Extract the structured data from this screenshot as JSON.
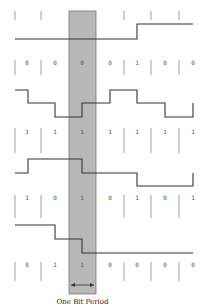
{
  "diagram": {
    "caption": "One Bit Period",
    "band": {
      "x": 69,
      "y": 11,
      "width": 27,
      "height": 283,
      "fill": "#b8b8b8",
      "stroke": "#777777"
    },
    "line_color": "#333333",
    "tick_color": "#888888",
    "digit_x": [
      27,
      55,
      82,
      110,
      137,
      165,
      193
    ],
    "tick_x": [
      15,
      41,
      124,
      151,
      179
    ],
    "rows": [
      {
        "id": "row-1",
        "ticks_top": 11,
        "ticks_bottom": 20,
        "digits": [],
        "digit_y": 0
      },
      {
        "id": "row-2",
        "ticks_top": 60,
        "ticks_bottom": 75,
        "digits": [
          "0",
          "0",
          "0",
          "0",
          "1",
          "0",
          "0"
        ],
        "digit_y": 65
      },
      {
        "id": "row-3",
        "ticks_top": 128,
        "ticks_bottom": 153,
        "digits": [
          "1",
          "1",
          "1",
          "1",
          "1",
          "1",
          "1"
        ],
        "digit_y": 134
      },
      {
        "id": "row-4",
        "ticks_top": 195,
        "ticks_bottom": 218,
        "digits": [
          "1",
          "0",
          "1",
          "0",
          "1",
          "0",
          "1"
        ],
        "digit_y": 200
      },
      {
        "id": "row-5",
        "ticks_top": 262,
        "ticks_bottom": 281,
        "digits": [
          "0",
          "1",
          "1",
          "0",
          "0",
          "0",
          "0"
        ],
        "digit_y": 267
      }
    ],
    "waveforms": [
      {
        "id": "waveform-1",
        "points": "15,39 137,39 137,24 193,24"
      },
      {
        "id": "waveform-2",
        "points": "15,90 28,90 28,103 55,103 55,117 82,117 82,103 110,103 110,90 137,90 137,103 165,103 165,117 193,117 193,103"
      },
      {
        "id": "waveform-3",
        "points": "15,173 28,173 28,159 82,159 82,173 137,173 137,186 193,186 193,173"
      },
      {
        "id": "waveform-4",
        "points": "15,225 55,225 55,239 82,239 82,253 193,253"
      }
    ],
    "arrow": {
      "y": 285,
      "x1": 71,
      "x2": 94
    }
  }
}
